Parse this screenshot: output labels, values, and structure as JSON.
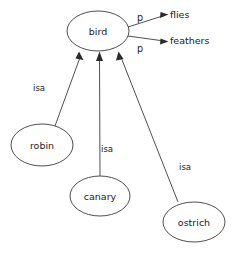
{
  "diagram": {
    "type": "semantic-network",
    "background_color": "#ffffff",
    "stroke_color": "#3b3b3b",
    "text_color": "#1a1a1a",
    "nodes": [
      {
        "id": "bird",
        "label": "bird",
        "cx": 98,
        "cy": 31,
        "rx": 31,
        "ry": 20
      },
      {
        "id": "robin",
        "label": "robin",
        "cx": 42,
        "cy": 145,
        "rx": 31,
        "ry": 21
      },
      {
        "id": "canary",
        "label": "canary",
        "cx": 100,
        "cy": 196,
        "rx": 30,
        "ry": 20
      },
      {
        "id": "ostrich",
        "label": "ostrich",
        "cx": 194,
        "cy": 222,
        "rx": 31,
        "ry": 20
      }
    ],
    "values": [
      {
        "id": "flies",
        "label": "flies",
        "x": 170,
        "y": 18
      },
      {
        "id": "feathers",
        "label": "feathers",
        "x": 170,
        "y": 44
      }
    ],
    "edges": [
      {
        "id": "robin-isa-bird",
        "from": "robin",
        "to": "bird",
        "label": "isa",
        "label_x": 33,
        "label_y": 91,
        "x1": 55,
        "y1": 126,
        "x2": 79,
        "y2": 54
      },
      {
        "id": "canary-isa-bird",
        "from": "canary",
        "to": "bird",
        "label": "isa",
        "label_x": 101,
        "label_y": 152,
        "x1": 100,
        "y1": 176,
        "x2": 99,
        "y2": 55
      },
      {
        "id": "ostrich-isa-bird",
        "from": "ostrich",
        "to": "bird",
        "label": "isa",
        "label_x": 179,
        "label_y": 170,
        "x1": 178,
        "y1": 202,
        "x2": 119,
        "y2": 54
      },
      {
        "id": "bird-p-flies",
        "from": "bird",
        "to": "flies",
        "label": "p",
        "label_x": 137,
        "label_y": 21,
        "x1": 128,
        "y1": 27,
        "x2": 166,
        "y2": 15
      },
      {
        "id": "bird-p-feathers",
        "from": "bird",
        "to": "feathers",
        "label": "p",
        "label_x": 139,
        "label_y": 52,
        "x1": 128,
        "y1": 36,
        "x2": 166,
        "y2": 41
      }
    ]
  }
}
